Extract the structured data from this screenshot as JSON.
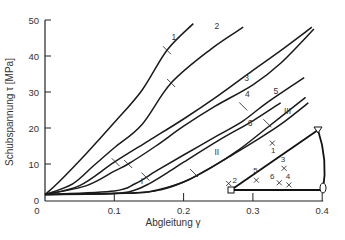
{
  "chart_data": {
    "type": "line",
    "title": "",
    "xlabel": "Abgleitung γ",
    "ylabel": "Schubspannung τ [MPa]",
    "xlim": [
      0,
      0.4
    ],
    "ylim": [
      0,
      50
    ],
    "xticks": [
      "0",
      "0.1",
      "0.2",
      "0.3",
      "0.4"
    ],
    "yticks": [
      "0",
      "10",
      "20",
      "30",
      "40",
      "50"
    ],
    "grid": false,
    "legend": "inline curve labels",
    "series": [
      {
        "name": "1",
        "points": [
          [
            0,
            1.5
          ],
          [
            0.02,
            5
          ],
          [
            0.06,
            13
          ],
          [
            0.1,
            21.5
          ],
          [
            0.14,
            30.5
          ],
          [
            0.176,
            41.6
          ],
          [
            0.214,
            49
          ]
        ],
        "tick": [
          0.176,
          41.6
        ]
      },
      {
        "name": "2",
        "points": [
          [
            0,
            1.5
          ],
          [
            0.04,
            4.5
          ],
          [
            0.07,
            9.5
          ],
          [
            0.1,
            14.5
          ],
          [
            0.14,
            21
          ],
          [
            0.182,
            32.5
          ],
          [
            0.24,
            42
          ],
          [
            0.286,
            48
          ]
        ],
        "tick": [
          0.182,
          32.5
        ]
      },
      {
        "name": "3",
        "points": [
          [
            0,
            1.5
          ],
          [
            0.05,
            4
          ],
          [
            0.1,
            10.5
          ],
          [
            0.15,
            16.5
          ],
          [
            0.2,
            22.5
          ],
          [
            0.25,
            29
          ],
          [
            0.3,
            36
          ],
          [
            0.34,
            41.5
          ],
          [
            0.385,
            48
          ]
        ],
        "tick": [
          0.102,
          10.5
        ]
      },
      {
        "name": "4",
        "points": [
          [
            0,
            1.5
          ],
          [
            0.06,
            4
          ],
          [
            0.1,
            8
          ],
          [
            0.12,
            10
          ],
          [
            0.16,
            15
          ],
          [
            0.2,
            20.5
          ],
          [
            0.245,
            26
          ],
          [
            0.3,
            32
          ],
          [
            0.34,
            38
          ],
          [
            0.388,
            47.5
          ]
        ],
        "tick": [
          0.12,
          10
        ]
      },
      {
        "name": "5",
        "points": [
          [
            0,
            1.5
          ],
          [
            0.1,
            2.5
          ],
          [
            0.13,
            4.5
          ],
          [
            0.16,
            8
          ],
          [
            0.2,
            12.5
          ],
          [
            0.25,
            18
          ],
          [
            0.286,
            22
          ],
          [
            0.32,
            27
          ],
          [
            0.374,
            34
          ]
        ],
        "tick": [
          0.286,
          26
        ]
      },
      {
        "name": "6",
        "points": [
          [
            0,
            1.5
          ],
          [
            0.13,
            2
          ],
          [
            0.17,
            3
          ],
          [
            0.2,
            5
          ],
          [
            0.24,
            9
          ],
          [
            0.28,
            14
          ],
          [
            0.32,
            20
          ],
          [
            0.376,
            28.5
          ]
        ],
        "tick": [
          0.321,
          21.3
        ]
      },
      {
        "name": "I",
        "points": [
          [
            0,
            1.5
          ],
          [
            0.1,
            1.8
          ],
          [
            0.13,
            2.8
          ],
          [
            0.15,
            4.5
          ],
          [
            0.18,
            8
          ],
          [
            0.2,
            10.5
          ],
          [
            0.25,
            16.5
          ],
          [
            0.3,
            22
          ],
          [
            0.34,
            27
          ]
        ],
        "tick": [
          0.145,
          6.5
        ]
      },
      {
        "name": "II",
        "points": [
          [
            0,
            1.5
          ],
          [
            0.1,
            1.8
          ],
          [
            0.15,
            2.3
          ],
          [
            0.2,
            5
          ],
          [
            0.23,
            8
          ],
          [
            0.27,
            12.5
          ],
          [
            0.3,
            16
          ],
          [
            0.34,
            21
          ],
          [
            0.38,
            27
          ]
        ],
        "tick": [
          0.215,
          7.5
        ]
      }
    ],
    "series_labels": {
      "1": [
        0.186,
        44.5
      ],
      "2": [
        0.248,
        47.5
      ],
      "3": [
        0.291,
        33
      ],
      "4": [
        0.292,
        28.5
      ],
      "5": [
        0.333,
        29.5
      ],
      "III": [
        0.35,
        24
      ],
      "6": [
        0.296,
        20.5
      ],
      "II": [
        0.248,
        12.5
      ],
      "I": [
        0.14,
        4.5
      ]
    },
    "inset": {
      "type": "triangle diagram",
      "vertices": {
        "bottom_left": "square",
        "top": "triangle",
        "bottom_right": "circle"
      },
      "markers": [
        {
          "label": "1",
          "pos": [
            0.328,
            15.8
          ]
        },
        {
          "label": "2",
          "pos": [
            0.265,
            4.6
          ]
        },
        {
          "label": "3",
          "pos": [
            0.345,
            8.8
          ]
        },
        {
          "label": "4",
          "pos": [
            0.352,
            4.2
          ]
        },
        {
          "label": "5",
          "pos": [
            0.305,
            5.5
          ]
        },
        {
          "label": "6",
          "pos": [
            0.338,
            4.8
          ]
        }
      ]
    }
  }
}
